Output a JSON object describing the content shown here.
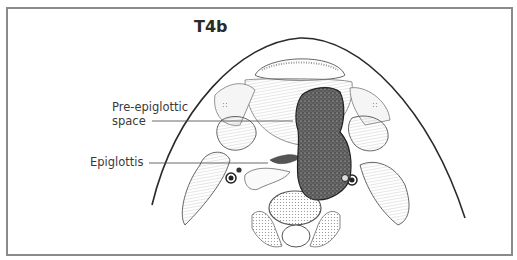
{
  "figure": {
    "title": "T4b",
    "labels": {
      "pre_epiglottic_line1": "Pre-epiglottic",
      "pre_epiglottic_line2": "space",
      "epiglottis": "Epiglottis"
    },
    "colors": {
      "frame": "#8a8a8a",
      "ink": "#2a2a2a",
      "tumor": "#4a4a4a",
      "background": "#ffffff"
    }
  }
}
